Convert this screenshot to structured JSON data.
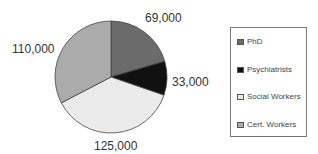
{
  "chart_data": {
    "type": "pie",
    "title": "",
    "categories": [
      "PhD",
      "Psychiatrists",
      "Social Workers",
      "Cert. Workers"
    ],
    "values": [
      69000,
      33000,
      125000,
      110000
    ],
    "labels": [
      "69,000",
      "33,000",
      "125,000",
      "110,000"
    ],
    "colors": [
      "#6b6b6b",
      "#111111",
      "#ebebeb",
      "#ababab"
    ],
    "legend_position": "right"
  },
  "legend": {
    "items": [
      {
        "label": "PhD",
        "color": "#6b6b6b"
      },
      {
        "label": "Psychiatrists",
        "color": "#111111"
      },
      {
        "label": "Social Workers",
        "color": "#ebebeb"
      },
      {
        "label": "Cert. Workers",
        "color": "#ababab"
      }
    ]
  }
}
